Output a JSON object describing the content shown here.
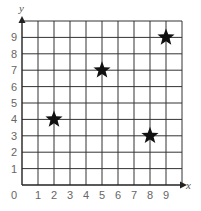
{
  "chart_data": {
    "type": "scatter",
    "title": "",
    "xlabel": "x",
    "ylabel": "y",
    "xlim": [
      0,
      10
    ],
    "ylim": [
      0,
      10
    ],
    "grid": true,
    "x_ticks": [
      "0",
      "1",
      "2",
      "3",
      "4",
      "5",
      "6",
      "7",
      "8",
      "9"
    ],
    "y_ticks": [
      "1",
      "2",
      "3",
      "4",
      "5",
      "6",
      "7",
      "8",
      "9"
    ],
    "marker": "star",
    "series": [
      {
        "name": "points",
        "points": [
          {
            "x": 2,
            "y": 4
          },
          {
            "x": 5,
            "y": 7
          },
          {
            "x": 8,
            "y": 3
          },
          {
            "x": 9,
            "y": 9
          }
        ]
      }
    ],
    "colors": {
      "grid": "#333333",
      "marker": "#111111",
      "tick_text": "#666666"
    }
  }
}
